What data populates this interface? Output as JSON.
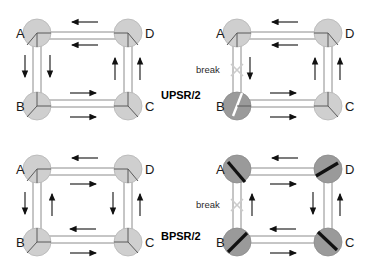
{
  "figure": {
    "background": "#ffffff",
    "link_color": "#8c8c8c",
    "arrow_color": "#111111",
    "node_fill_light": "#cfcfcf",
    "node_fill_dark": "#9a9a9a",
    "node_stroke": "#b5b5b5",
    "wedge_thin_color": "#5a5a5a",
    "wedge_thick_color": "#111111",
    "break_x_color": "#cccccc"
  },
  "panels": [
    {
      "id": "upsr-normal",
      "scheme_label": "",
      "state": "normal",
      "has_break": false,
      "break_label": "",
      "nodes": [
        {
          "id": "A",
          "label": "A",
          "label_side": "left",
          "fill": "light",
          "wedge": "thin"
        },
        {
          "id": "D",
          "label": "D",
          "label_side": "right",
          "fill": "light",
          "wedge": "thin"
        },
        {
          "id": "B",
          "label": "B",
          "label_side": "left",
          "fill": "light",
          "wedge": "thin"
        },
        {
          "id": "C",
          "label": "C",
          "label_side": "right",
          "fill": "light",
          "wedge": "thin"
        }
      ],
      "arrows": [
        {
          "side": "top",
          "lane": "outer",
          "dir": "left"
        },
        {
          "side": "top",
          "lane": "inner",
          "dir": "left"
        },
        {
          "side": "left",
          "lane": "outer",
          "dir": "down"
        },
        {
          "side": "left",
          "lane": "inner",
          "dir": "down"
        },
        {
          "side": "bottom",
          "lane": "inner",
          "dir": "right"
        },
        {
          "side": "bottom",
          "lane": "outer",
          "dir": "right"
        },
        {
          "side": "right",
          "lane": "inner",
          "dir": "up"
        },
        {
          "side": "right",
          "lane": "outer",
          "dir": "up"
        }
      ]
    },
    {
      "id": "upsr-break",
      "scheme_label": "UPSR/2",
      "state": "break",
      "has_break": true,
      "break_label": "break",
      "nodes": [
        {
          "id": "A",
          "label": "A",
          "label_side": "left",
          "fill": "light",
          "wedge": "thin"
        },
        {
          "id": "D",
          "label": "D",
          "label_side": "right",
          "fill": "light",
          "wedge": "thin"
        },
        {
          "id": "B",
          "label": "B",
          "label_side": "left",
          "fill": "dark",
          "wedge": "slit"
        },
        {
          "id": "C",
          "label": "C",
          "label_side": "right",
          "fill": "light",
          "wedge": "thin"
        }
      ],
      "arrows": [
        {
          "side": "top",
          "lane": "outer",
          "dir": "left"
        },
        {
          "side": "top",
          "lane": "inner",
          "dir": "left"
        },
        {
          "side": "left",
          "lane": "inner",
          "dir": "down"
        },
        {
          "side": "bottom",
          "lane": "inner",
          "dir": "right"
        },
        {
          "side": "bottom",
          "lane": "outer",
          "dir": "right"
        },
        {
          "side": "right",
          "lane": "inner",
          "dir": "up"
        },
        {
          "side": "right",
          "lane": "outer",
          "dir": "up"
        }
      ]
    },
    {
      "id": "bpsr-normal",
      "scheme_label": "",
      "state": "normal",
      "has_break": false,
      "break_label": "",
      "nodes": [
        {
          "id": "A",
          "label": "A",
          "label_side": "left",
          "fill": "light",
          "wedge": "thin"
        },
        {
          "id": "D",
          "label": "D",
          "label_side": "right",
          "fill": "light",
          "wedge": "thin"
        },
        {
          "id": "B",
          "label": "B",
          "label_side": "left",
          "fill": "light",
          "wedge": "thin"
        },
        {
          "id": "C",
          "label": "C",
          "label_side": "right",
          "fill": "light",
          "wedge": "thin"
        }
      ],
      "arrows": [
        {
          "side": "top",
          "lane": "outer",
          "dir": "left"
        },
        {
          "side": "top",
          "lane": "inner",
          "dir": "right"
        },
        {
          "side": "left",
          "lane": "outer",
          "dir": "down"
        },
        {
          "side": "left",
          "lane": "inner",
          "dir": "up"
        },
        {
          "side": "bottom",
          "lane": "inner",
          "dir": "left"
        },
        {
          "side": "bottom",
          "lane": "outer",
          "dir": "right"
        },
        {
          "side": "right",
          "lane": "inner",
          "dir": "down"
        },
        {
          "side": "right",
          "lane": "outer",
          "dir": "up"
        }
      ]
    },
    {
      "id": "bpsr-break",
      "scheme_label": "BPSR/2",
      "state": "break",
      "has_break": true,
      "break_label": "break",
      "nodes": [
        {
          "id": "A",
          "label": "A",
          "label_side": "left",
          "fill": "dark",
          "wedge": "thick"
        },
        {
          "id": "D",
          "label": "D",
          "label_side": "right",
          "fill": "dark",
          "wedge": "thick"
        },
        {
          "id": "B",
          "label": "B",
          "label_side": "left",
          "fill": "dark",
          "wedge": "thick"
        },
        {
          "id": "C",
          "label": "C",
          "label_side": "right",
          "fill": "dark",
          "wedge": "thick"
        }
      ],
      "arrows": [
        {
          "side": "top",
          "lane": "outer",
          "dir": "left"
        },
        {
          "side": "top",
          "lane": "inner",
          "dir": "right"
        },
        {
          "side": "left",
          "lane": "inner",
          "dir": "up"
        },
        {
          "side": "bottom",
          "lane": "inner",
          "dir": "left"
        },
        {
          "side": "bottom",
          "lane": "outer",
          "dir": "right"
        },
        {
          "side": "right",
          "lane": "inner",
          "dir": "down"
        },
        {
          "side": "right",
          "lane": "outer",
          "dir": "up"
        }
      ]
    }
  ],
  "labels": {
    "upsr": "UPSR/2",
    "bpsr": "BPSR/2",
    "break": "break"
  }
}
